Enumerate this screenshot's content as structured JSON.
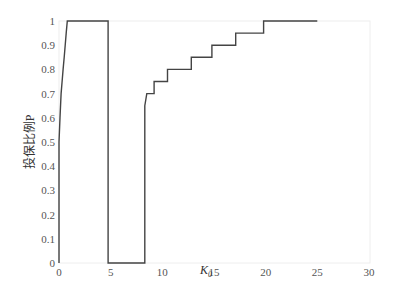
{
  "chart_data": {
    "type": "line",
    "title": "",
    "xlabel": "K",
    "xlabel_subscript": "0",
    "ylabel": "投保比例P",
    "xlim": [
      0,
      30
    ],
    "ylim": [
      0,
      1
    ],
    "xticks": [
      0,
      5,
      10,
      15,
      20,
      25,
      30
    ],
    "yticks": [
      0,
      0.1,
      0.2,
      0.3,
      0.4,
      0.5,
      0.6,
      0.7,
      0.8,
      0.9,
      1
    ],
    "ytick_labels": [
      "0",
      "0.1",
      "0.2",
      "0.3",
      "0.4",
      "0.5",
      "0.6",
      "0.7",
      "0.8",
      "0.9",
      "1"
    ],
    "grid": false,
    "legend": null,
    "step": true,
    "series": [
      {
        "name": "P",
        "color": "#444444",
        "x": [
          0,
          0,
          0.1,
          0.2,
          0.3,
          0.4,
          0.5,
          0.6,
          0.7,
          0.8,
          4.75,
          4.75,
          8.3,
          8.3,
          8.5,
          8.5,
          9.2,
          9.2,
          10.5,
          10.5,
          12.8,
          12.8,
          14.8,
          14.8,
          17.1,
          17.1,
          19.8,
          19.8,
          25.0
        ],
        "y": [
          0,
          0.5,
          0.6,
          0.7,
          0.75,
          0.8,
          0.85,
          0.9,
          0.95,
          1.0,
          1.0,
          0,
          0,
          0.65,
          0.7,
          0.7,
          0.7,
          0.75,
          0.75,
          0.8,
          0.8,
          0.85,
          0.85,
          0.9,
          0.9,
          0.95,
          0.95,
          1.0,
          1.0
        ]
      }
    ]
  }
}
